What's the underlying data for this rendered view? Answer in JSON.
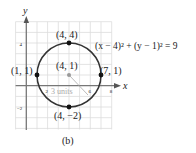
{
  "figure": {
    "caption": "(b)",
    "equation": "(x − 4)² + (y − 1)² = 9",
    "axes": {
      "x_label": "x",
      "y_label": "y"
    },
    "ticks": {
      "x": [
        "2",
        "6",
        "8"
      ],
      "y": [
        "4",
        "−2"
      ]
    },
    "center": {
      "label": "(4, 1)",
      "x": 4,
      "y": 1
    },
    "radius": {
      "label": "3 units",
      "value": 3
    },
    "points": [
      {
        "label": "(4, 4)",
        "x": 4,
        "y": 4
      },
      {
        "label": "(1, 1)",
        "x": 1,
        "y": 1
      },
      {
        "label": "(7, 1)",
        "x": 7,
        "y": 1
      },
      {
        "label": "(4, −2)",
        "x": 4,
        "y": -2
      }
    ],
    "colors": {
      "grid": "#d8d8d8",
      "axis": "#777777",
      "circle": "#333333",
      "point": "#111111",
      "center": "#999999"
    }
  }
}
